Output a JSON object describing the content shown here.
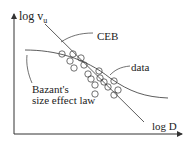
{
  "diagram": {
    "y_axis_label": "log v",
    "y_axis_subscript": "u",
    "x_axis_label": "log D",
    "labels": {
      "ceb": "CEB",
      "data": "data",
      "bazant_line1": "Bazant's",
      "bazant_line2": "size effect law"
    },
    "colors": {
      "line": "#333333",
      "text": "#222222",
      "background": "#ffffff"
    }
  }
}
